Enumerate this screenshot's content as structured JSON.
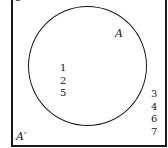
{
  "diagram": {
    "type": "venn",
    "universal_set": {
      "label": "U"
    },
    "sets": [
      {
        "label": "A",
        "elements": [
          "1",
          "2",
          "5"
        ]
      }
    ],
    "complement": {
      "label": "A′",
      "elements": [
        "3",
        "4",
        "6",
        "7"
      ]
    }
  }
}
